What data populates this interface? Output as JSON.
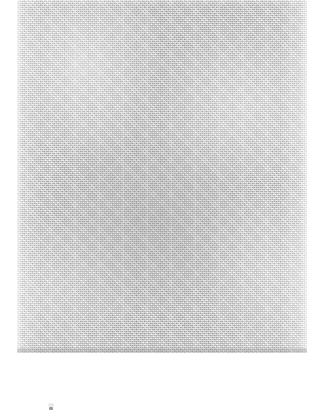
{
  "page": {
    "kind": "scanned-page",
    "width": 317,
    "height": 417,
    "background_color": "#ffffff",
    "readable_text": "",
    "note": ""
  },
  "scan_region": {
    "label": "",
    "base_color": "#c9c9c9",
    "left": 17,
    "top": 0,
    "width": 290,
    "height": 353,
    "texture": "halftone-grain"
  },
  "lower_margin": {
    "label": "",
    "color": "#ffffff"
  },
  "artifacts": {
    "speck_label": ""
  }
}
